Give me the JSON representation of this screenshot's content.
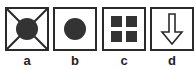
{
  "options": [
    {
      "label": "a",
      "icon": "circle-with-x-icon"
    },
    {
      "label": "b",
      "icon": "filled-circle-icon"
    },
    {
      "label": "c",
      "icon": "four-squares-grid-icon"
    },
    {
      "label": "d",
      "icon": "down-arrow-icon"
    }
  ],
  "colors": {
    "stroke": "#2a2a2a",
    "fill": "#333333",
    "background": "#ffffff"
  }
}
